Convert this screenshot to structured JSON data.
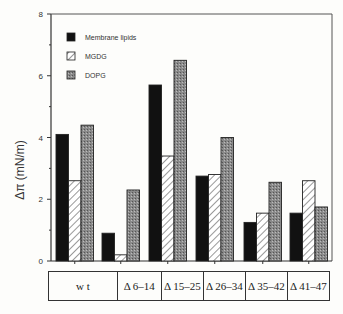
{
  "chart_data": {
    "type": "bar",
    "title": "",
    "xlabel": "",
    "ylabel": "Δπ   (mN/m)",
    "ylim": [
      0,
      8
    ],
    "yticks": [
      0,
      2,
      4,
      6,
      8
    ],
    "grid": false,
    "legend_position": "upper left inside",
    "categories": [
      "w t",
      "Δ 6–14",
      "Δ 15–25",
      "Δ 26–34",
      "Δ 35–42",
      "Δ 41–47"
    ],
    "series": [
      {
        "name": "Membrane lipids",
        "pattern": "solid-black",
        "values": [
          4.1,
          0.9,
          5.7,
          2.75,
          1.25,
          1.55
        ]
      },
      {
        "name": "MGDG",
        "pattern": "diagonal-hatch",
        "values": [
          2.6,
          0.2,
          3.4,
          2.8,
          1.55,
          2.6
        ]
      },
      {
        "name": "DOPG",
        "pattern": "gray-stipple",
        "values": [
          4.4,
          2.3,
          6.5,
          4.0,
          2.55,
          1.75
        ]
      }
    ]
  },
  "axis": {
    "ylabel": "Δπ   (mN/m)",
    "ticks": [
      "0",
      "2",
      "4",
      "6",
      "8"
    ]
  },
  "legend": [
    "Membrane lipids",
    "MGDG",
    "DOPG"
  ],
  "table": [
    "w t",
    "Δ 6–14",
    "Δ 15–25",
    "Δ 26–34",
    "Δ 35–42",
    "Δ 41–47"
  ]
}
